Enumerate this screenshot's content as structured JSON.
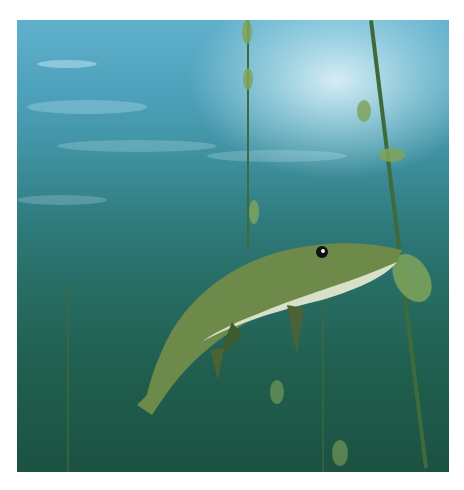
{
  "image": {
    "subject": "northern pike swimming underwater among aquatic plant stems",
    "colors": {
      "water_top": "#5fb0cc",
      "water_bottom": "#1b5242",
      "fish_body": "#6d8a4a",
      "fish_belly": "#d8e0c8",
      "plants": "#7fa35a",
      "frame": "#ffffff"
    }
  }
}
